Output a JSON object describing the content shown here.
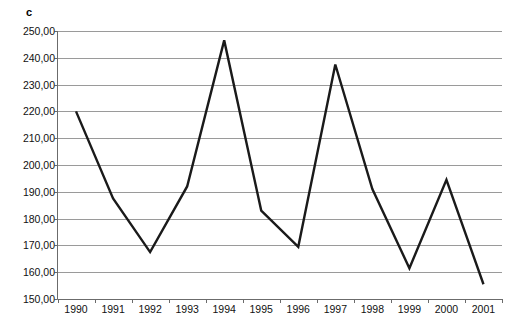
{
  "chart_data": {
    "type": "line",
    "title": "c",
    "xlabel": "",
    "ylabel": "",
    "categories": [
      "1990",
      "1991",
      "1992",
      "1993",
      "1994",
      "1995",
      "1996",
      "1997",
      "1998",
      "1999",
      "2000",
      "2001"
    ],
    "values": [
      220.0,
      187.5,
      167.5,
      192.0,
      246.5,
      183.0,
      169.5,
      237.5,
      191.0,
      161.5,
      194.5,
      155.5
    ],
    "series": [
      {
        "name": "c",
        "values": [
          220.0,
          187.5,
          167.5,
          192.0,
          246.5,
          183.0,
          169.5,
          237.5,
          191.0,
          161.5,
          194.5,
          155.5
        ]
      }
    ],
    "ylim": [
      150,
      250
    ],
    "ytick_step": 10,
    "ytick_labels": [
      "150,00",
      "160,00",
      "170,00",
      "180,00",
      "190,00",
      "200,00",
      "210,00",
      "220,00",
      "230,00",
      "240,00",
      "250,00"
    ],
    "ytick_values": [
      150,
      160,
      170,
      180,
      190,
      200,
      210,
      220,
      230,
      240,
      250
    ],
    "grid": true,
    "grid_axis": "y",
    "legend": false,
    "legend_position": "none",
    "markers": false,
    "colors": {
      "line": "#1a1a1a",
      "grid": "#9a9a9a",
      "axis": "#6b6b6b",
      "background": "#ffffff",
      "text": "#111111"
    }
  }
}
